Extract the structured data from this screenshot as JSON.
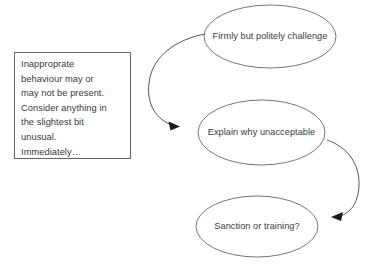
{
  "diagram": {
    "type": "flowchart",
    "background_color": "#ffffff",
    "stroke_color": "#555555",
    "text_color": "#3a3a3a",
    "note": {
      "shape": "rectangle",
      "text": "Inapproprate behaviour may or may not be present. Consider anything in the slightest bit unusual. Immediately…",
      "lines": "Inapproprate\nbehaviour may or\nmay not be present.\nConsider anything in\nthe slightest bit\nunusual.\nImmediately…"
    },
    "nodes": [
      {
        "id": "firmly-but-politely-challenge",
        "shape": "ellipse",
        "text": "Firmly but politely challenge",
        "lines": "Firmly but politely\nchallenge"
      },
      {
        "id": "explain-why-unacceptable",
        "shape": "ellipse",
        "text": "Explain why unacceptable",
        "lines": "Explain why\nunacceptable"
      },
      {
        "id": "sanction-or-training",
        "shape": "ellipse",
        "text": "Sanction or training?",
        "lines": "Sanction or training?"
      }
    ],
    "connectors": [
      {
        "id": "challenge-to-explain",
        "from": "firmly-but-politely-challenge",
        "to": "explain-why-unacceptable",
        "style": "curved-arrow",
        "direction": "left-loop-down"
      },
      {
        "id": "explain-to-sanction",
        "from": "explain-why-unacceptable",
        "to": "sanction-or-training",
        "style": "curved-arrow",
        "direction": "right-loop-down"
      }
    ]
  }
}
